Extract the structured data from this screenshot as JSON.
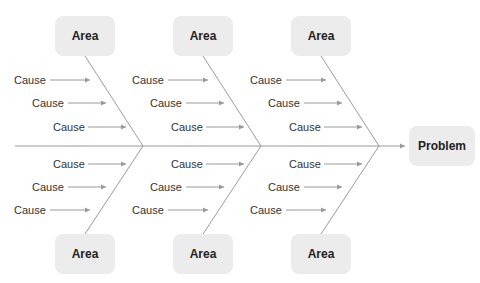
{
  "diagram": {
    "type": "fishbone",
    "problem": {
      "label": "Problem"
    },
    "line_color": "#9a9a9a",
    "box_color": "#ececec",
    "top_areas": [
      {
        "label": "Area",
        "causes": [
          "Cause",
          "Cause",
          "Cause"
        ]
      },
      {
        "label": "Area",
        "causes": [
          "Cause",
          "Cause",
          "Cause"
        ]
      },
      {
        "label": "Area",
        "causes": [
          "Cause",
          "Cause",
          "Cause"
        ]
      }
    ],
    "bottom_areas": [
      {
        "label": "Area",
        "causes": [
          "Cause",
          "Cause",
          "Cause"
        ]
      },
      {
        "label": "Area",
        "causes": [
          "Cause",
          "Cause",
          "Cause"
        ]
      },
      {
        "label": "Area",
        "causes": [
          "Cause",
          "Cause",
          "Cause"
        ]
      }
    ]
  }
}
